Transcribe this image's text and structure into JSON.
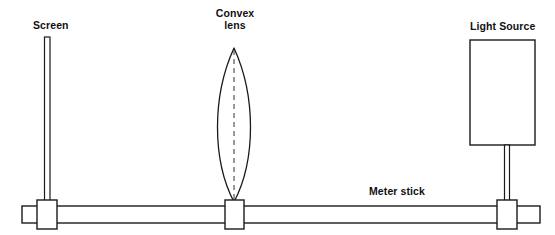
{
  "diagram": {
    "background_color": "#ffffff",
    "stroke_color": "#1a1a1a",
    "labels": {
      "screen": "Screen",
      "lens_line1": "Convex",
      "lens_line2": "lens",
      "light_source": "Light Source",
      "meter_stick": "Meter stick"
    },
    "components": {
      "screen": {
        "name": "Screen",
        "shape": "thin vertical rectangle",
        "x": 44,
        "y_top": 37,
        "y_bottom": 206,
        "width": 6
      },
      "screen_holder": {
        "name": "Screen holder block",
        "shape": "rectangle",
        "x": 37,
        "y": 200,
        "width": 20,
        "height": 29
      },
      "convex_lens": {
        "name": "Convex lens",
        "shape": "biconvex lens (vesica)",
        "apex_top_x": 234,
        "apex_top_y": 48,
        "apex_bottom_x": 234,
        "apex_bottom_y": 202,
        "max_width": 44,
        "center_x": 234,
        "axis_line": "dashed vertical"
      },
      "lens_holder": {
        "name": "Lens holder block",
        "shape": "rectangle",
        "x": 225,
        "y": 200,
        "width": 19,
        "height": 29
      },
      "light_source": {
        "name": "Light Source",
        "shape": "rectangle",
        "x": 470,
        "y": 40,
        "width": 65,
        "height": 105
      },
      "light_source_stem": {
        "name": "Light source support stem",
        "shape": "thin vertical rectangle",
        "x": 505,
        "y_top": 145,
        "y_bottom": 206,
        "width": 5
      },
      "light_source_holder": {
        "name": "Light source holder block",
        "shape": "rectangle",
        "x": 497,
        "y": 200,
        "width": 20,
        "height": 29
      },
      "meter_stick": {
        "name": "Meter stick",
        "shape": "long horizontal rectangle",
        "x": 22,
        "y": 206,
        "width": 518,
        "height": 17
      }
    }
  }
}
